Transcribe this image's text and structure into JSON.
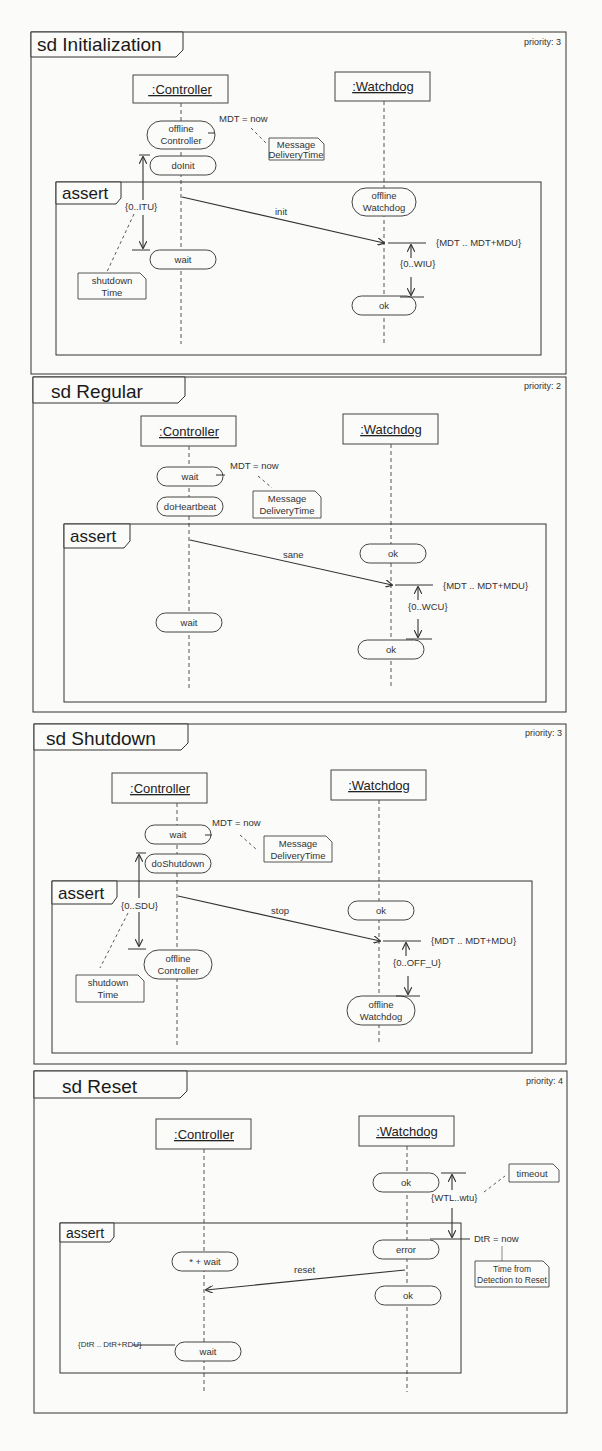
{
  "diagrams": [
    {
      "title": "sd Initialization",
      "priority": "priority: 3",
      "lifelines": [
        " :Controller",
        ":Watchdog"
      ],
      "assert_label": "assert",
      "states": [
        "offline",
        "Controller",
        "doInit",
        "wait",
        "offline",
        "Watchdog",
        "ok"
      ],
      "message": "init",
      "annotations": {
        "mdt": "MDT = now",
        "note_mdt": [
          "Message",
          "DeliveryTime"
        ],
        "interval": "{0..ITU}",
        "note_left": [
          "shutdown",
          "Time"
        ],
        "window": "{MDT .. MDT+MDU}",
        "duration": "{0..WIU}"
      }
    },
    {
      "title": "sd Regular",
      "priority": "priority: 2",
      "lifelines": [
        ":Controller",
        ":Watchdog"
      ],
      "assert_label": "assert",
      "states": [
        "wait",
        "doHeartbeat",
        "ok",
        "wait",
        "ok"
      ],
      "message": "sane",
      "annotations": {
        "mdt": "MDT = now",
        "note_mdt": [
          "Message",
          "DeliveryTime"
        ],
        "window": "{MDT .. MDT+MDU}",
        "duration": "{0..WCU}"
      }
    },
    {
      "title": "sd Shutdown",
      "priority": "priority: 3",
      "lifelines": [
        ":Controller",
        ":Watchdog"
      ],
      "assert_label": "assert",
      "states": [
        "wait",
        "doShutdown",
        "ok",
        "offline",
        "Controller",
        "offline",
        "Watchdog"
      ],
      "message": "stop",
      "annotations": {
        "mdt": "MDT = now",
        "note_mdt": [
          "Message",
          "DeliveryTime"
        ],
        "interval": "{0..SDU}",
        "note_left": [
          "shutdown",
          "Time"
        ],
        "window": "{MDT .. MDT+MDU}",
        "duration": "{0..OFF_U}"
      }
    },
    {
      "title": "sd Reset",
      "priority": "priority: 4",
      "lifelines": [
        ":Controller",
        ":Watchdog"
      ],
      "assert_label": "assert",
      "states": [
        "ok",
        "error",
        "* + wait",
        "ok",
        "wait"
      ],
      "message": "reset",
      "annotations": {
        "timeout_note": "timeout",
        "timeout_range": "{WTL..wtu}",
        "dtr": "DtR = now",
        "note_dtr": [
          "Time from",
          "Detection to Reset"
        ],
        "reset_window": "{DtR .. DtR+RDU}"
      }
    }
  ]
}
